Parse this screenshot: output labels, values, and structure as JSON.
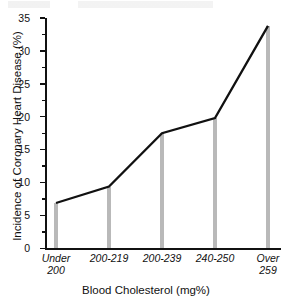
{
  "chart_data": {
    "type": "line",
    "title": "",
    "subtitle": "",
    "xlabel": "Blood Cholesterol (mg%)",
    "ylabel": "Incidence of Coronary Heart Disease (%)",
    "categories": [
      "Under\n200",
      "200-219",
      "200-239",
      "240-250",
      "Over\n259"
    ],
    "values": [
      6.9,
      9.4,
      17.5,
      19.8,
      33.8
    ],
    "series": [
      {
        "name": "Incidence of Coronary Heart Disease (%)",
        "values": [
          6.9,
          9.4,
          17.5,
          19.8,
          33.8
        ]
      }
    ],
    "ylim": [
      0,
      35
    ],
    "ytick_labels": [
      "0",
      "5",
      "10",
      "15",
      "20",
      "25",
      "30",
      "35"
    ],
    "ytick_values": [
      0,
      5,
      10,
      15,
      20,
      25,
      30,
      35
    ],
    "yminor_step": 2.5,
    "grid": false,
    "legend": "none",
    "drop_lines": true,
    "colors": {
      "line": "#111111",
      "bar": "#b9b9b9",
      "axis": "#111111",
      "background": "#ffffff"
    }
  }
}
